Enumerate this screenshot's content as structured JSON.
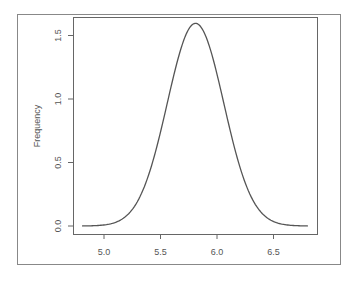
{
  "chart_data": {
    "type": "line",
    "title": "",
    "xlabel": "",
    "ylabel": "Frequency",
    "xlim": [
      4.8,
      6.85
    ],
    "ylim": [
      0.0,
      1.65
    ],
    "grid": false,
    "legend": null,
    "x_ticks": [
      5.0,
      5.5,
      6.0,
      6.5
    ],
    "x_tick_labels": [
      "5.0",
      "5.5",
      "6.0",
      "6.5"
    ],
    "y_ticks": [
      0.0,
      0.5,
      1.0,
      1.5
    ],
    "y_tick_labels": [
      "0.0",
      "0.5",
      "1.0",
      "1.5"
    ],
    "series": [
      {
        "name": "density",
        "color": "#555555",
        "x": [
          4.81,
          4.9,
          5.0,
          5.1,
          5.2,
          5.3,
          5.4,
          5.5,
          5.6,
          5.7,
          5.75,
          5.81,
          5.87,
          5.95,
          6.0,
          6.1,
          6.2,
          6.3,
          6.4,
          6.5,
          6.6,
          6.7,
          6.8
        ],
        "y": [
          0.0,
          0.02,
          0.04,
          0.12,
          0.3,
          0.6,
          0.9,
          1.18,
          1.4,
          1.55,
          1.58,
          1.6,
          1.58,
          1.47,
          1.38,
          1.03,
          0.74,
          0.46,
          0.25,
          0.1,
          0.04,
          0.02,
          0.01
        ]
      }
    ],
    "estimated_distribution": {
      "kind": "normal",
      "mean": 5.81,
      "sd": 0.25
    }
  },
  "labels": {
    "ylabel": "Frequency",
    "x_ticks": [
      "5.0",
      "5.5",
      "6.0",
      "6.5"
    ],
    "y_ticks": [
      "0.0",
      "0.5",
      "1.0",
      "1.5"
    ]
  },
  "colors": {
    "curve": "#555555",
    "axis": "#666666",
    "frame": "#888888",
    "text": "#555555"
  }
}
